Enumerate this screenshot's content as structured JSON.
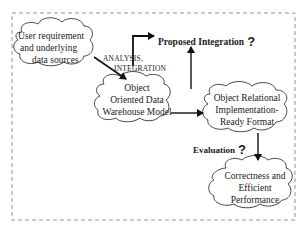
{
  "diagram": {
    "type": "flow",
    "frame": {
      "style": "dashed",
      "color": "#888888"
    },
    "nodes": [
      {
        "id": "source",
        "shape": "cloud",
        "lines": [
          "User requirement",
          "and underlying",
          "data sources"
        ]
      },
      {
        "id": "oodw",
        "shape": "cloud",
        "lines": [
          "Object",
          "Oriented Data",
          "Warehouse Model"
        ]
      },
      {
        "id": "ori",
        "shape": "cloud",
        "lines": [
          "Object Relational",
          "Implementation-",
          "Ready Format"
        ]
      },
      {
        "id": "perf",
        "shape": "cloud",
        "lines": [
          "Correctness and",
          "Efficient",
          "Performance"
        ]
      }
    ],
    "labels": {
      "analysis": [
        "ANALYSIS,",
        "INTEGRATION"
      ],
      "proposed": "Proposed Integration",
      "proposed_q": "?",
      "evaluation": "Evaluation",
      "evaluation_q": "?"
    },
    "edges": [
      {
        "from": "source",
        "to": "oodw",
        "label": "ANALYSIS, INTEGRATION"
      },
      {
        "from": "source",
        "to": "Proposed Integration",
        "style": "elbow"
      },
      {
        "from": "ori",
        "to": "Proposed Integration",
        "style": "vertical-up"
      },
      {
        "from": "oodw",
        "to": "ori"
      },
      {
        "from": "ori",
        "to": "perf",
        "label": "Evaluation ?"
      }
    ]
  }
}
